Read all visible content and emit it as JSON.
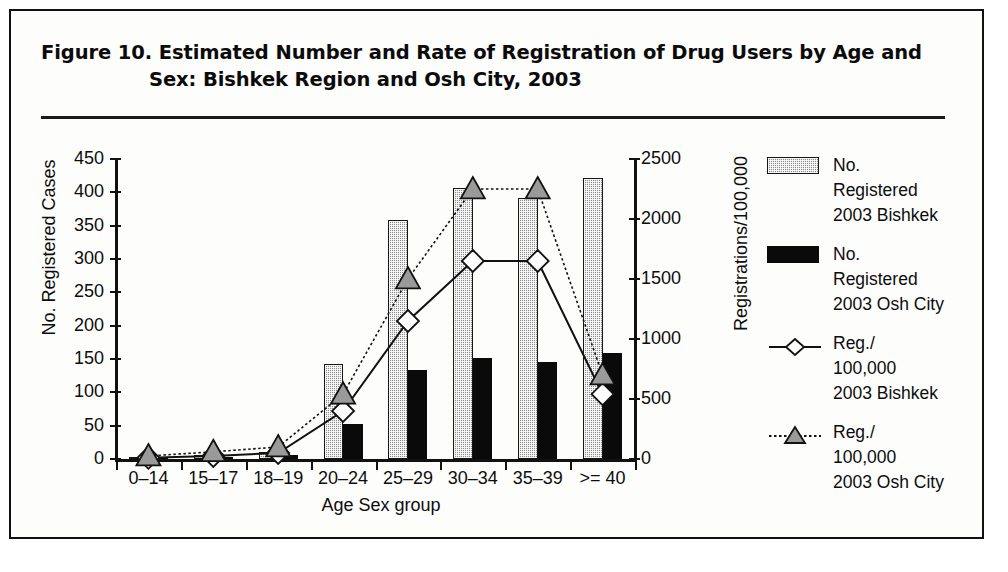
{
  "figure": {
    "title_line1": "Figure 10.  Estimated Number and Rate of Registration of Drug Users by Age and",
    "title_line2": "Sex: Bishkek Region and Osh City, 2003"
  },
  "legend": {
    "position": "right",
    "items": [
      {
        "key": "bar-bishkek",
        "marker": "filled-rect-hatched",
        "color": "#8c8c8c",
        "l1": "No.",
        "l2": "Registered",
        "l3": "2003 Bishkek"
      },
      {
        "key": "bar-osh",
        "marker": "filled-rect-solid",
        "color": "#0a0a0a",
        "l1": "No.",
        "l2": "Registered",
        "l3": "2003 Osh City"
      },
      {
        "key": "line-rate-bishkek",
        "marker": "diamond-line-solid",
        "color": "#111111",
        "l1": "Reg./",
        "l2": "100,000",
        "l3": "2003 Bishkek"
      },
      {
        "key": "line-rate-osh",
        "marker": "triangle-line-dotted",
        "color": "#111111",
        "l1": "Reg./",
        "l2": "100,000",
        "l3": "2003 Osh City"
      }
    ]
  },
  "chart_data": {
    "type": "bar",
    "title": "Figure 10. Estimated Number and Rate of Registration of Drug Users by Age and Sex: Bishkek Region and Osh City, 2003",
    "xlabel": "Age Sex group",
    "ylabel": "No. Registered Cases",
    "ylabel_right": "Registrations/100,000",
    "categories": [
      "0–14",
      "15–17",
      "18–19",
      "20–24",
      "25–29",
      "30–34",
      "35–39",
      ">= 40"
    ],
    "ylim": [
      0,
      450
    ],
    "yticks": [
      0,
      50,
      100,
      150,
      200,
      250,
      300,
      350,
      400,
      450
    ],
    "ylim_right": [
      0,
      2500
    ],
    "yticks_right": [
      0,
      500,
      1000,
      1500,
      2000,
      2500
    ],
    "grid": false,
    "series": [
      {
        "name": "No. Registered 2003 Bishkek",
        "kind": "bar",
        "axis": "left",
        "values": [
          2,
          6,
          11,
          143,
          359,
          407,
          391,
          422
        ]
      },
      {
        "name": "No. Registered 2003 Osh City",
        "kind": "bar",
        "axis": "left",
        "values": [
          1,
          2,
          6,
          53,
          133,
          152,
          145,
          159
        ]
      },
      {
        "name": "Reg./100,000 2003 Bishkek",
        "kind": "line",
        "axis": "right",
        "marker": "diamond",
        "linestyle": "solid",
        "values": [
          10,
          25,
          50,
          400,
          1150,
          1650,
          1650,
          540
        ]
      },
      {
        "name": "Reg./100,000 2003 Osh City",
        "kind": "line",
        "axis": "right",
        "marker": "triangle",
        "linestyle": "dotted",
        "values": [
          25,
          60,
          100,
          540,
          1500,
          2250,
          2250,
          700
        ]
      }
    ]
  }
}
